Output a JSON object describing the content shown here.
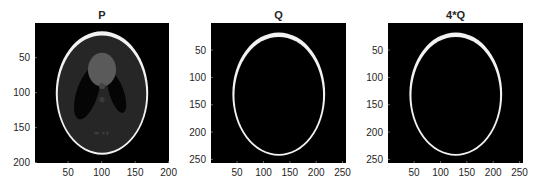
{
  "chart_data": [
    {
      "type": "heatmap",
      "title": "P",
      "description": "Shepp-Logan phantom image (grayscale)",
      "xlabel": "",
      "ylabel": "",
      "xlim": [
        0.5,
        200.5
      ],
      "ylim": [
        0.5,
        200.5
      ],
      "xticks": [
        50,
        100,
        150,
        200
      ],
      "yticks": [
        50,
        100,
        150,
        200
      ],
      "box": {
        "left": 35,
        "top": 23,
        "right": 169,
        "bottom": 163
      },
      "image": "phantom"
    },
    {
      "type": "heatmap",
      "title": "Q",
      "description": "Single bright elliptical ring on black background",
      "xlabel": "",
      "ylabel": "",
      "xlim": [
        0.5,
        256.5
      ],
      "ylim": [
        0.5,
        256.5
      ],
      "xticks": [
        50,
        100,
        150,
        200,
        250
      ],
      "yticks": [
        50,
        100,
        150,
        200,
        250
      ],
      "box": {
        "left": 211,
        "top": 23,
        "right": 346,
        "bottom": 163
      },
      "image": "ring"
    },
    {
      "type": "heatmap",
      "title": "4*Q",
      "description": "Single bright elliptical ring on black background (scaled)",
      "xlabel": "",
      "ylabel": "",
      "xlim": [
        0.5,
        256.5
      ],
      "ylim": [
        0.5,
        256.5
      ],
      "xticks": [
        50,
        100,
        150,
        200,
        250
      ],
      "yticks": [
        50,
        100,
        150,
        200,
        250
      ],
      "box": {
        "left": 388,
        "top": 23,
        "right": 523,
        "bottom": 163
      },
      "image": "ring"
    }
  ],
  "colors": {
    "background": "#000000",
    "ring": "#f2f2f2",
    "tissue": "#262626",
    "ventricle": "#050505",
    "lesion": "#5a5a5a",
    "text": "#262626"
  }
}
